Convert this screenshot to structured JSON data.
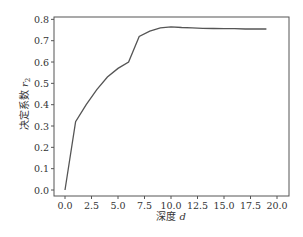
{
  "chart_data": {
    "type": "line",
    "title": "",
    "xlabel": "深度 d",
    "ylabel": "决定系数 r₂",
    "xlabel_text": "深度",
    "xlabel_var": "d",
    "ylabel_text": "决定系数",
    "ylabel_var": "r",
    "ylabel_sub": "2",
    "xlim": [
      -1.0,
      21.3
    ],
    "ylim": [
      -0.04,
      0.8
    ],
    "xticks": [
      0.0,
      2.5,
      5.0,
      7.5,
      10.0,
      12.5,
      15.0,
      17.5,
      20.0
    ],
    "xtick_labels": [
      "0.0",
      "2.5",
      "5.0",
      "7.5",
      "10.0",
      "12.5",
      "15.0",
      "17.5",
      "20.0"
    ],
    "yticks": [
      0.0,
      0.1,
      0.2,
      0.3,
      0.4,
      0.5,
      0.6,
      0.7,
      0.8
    ],
    "ytick_labels": [
      "0.0",
      "0.1",
      "0.2",
      "0.3",
      "0.4",
      "0.5",
      "0.6",
      "0.7",
      "0.8"
    ],
    "grid": false,
    "legend": null,
    "line_color": "#555555",
    "series": [
      {
        "name": "r2",
        "x": [
          0,
          1,
          2,
          3,
          4,
          5,
          6,
          7,
          8,
          9,
          10,
          11,
          12,
          13,
          14,
          15,
          16,
          17,
          18,
          19
        ],
        "values": [
          0.0,
          0.32,
          0.4,
          0.47,
          0.53,
          0.57,
          0.6,
          0.72,
          0.745,
          0.76,
          0.765,
          0.762,
          0.76,
          0.758,
          0.757,
          0.756,
          0.756,
          0.755,
          0.755,
          0.755
        ]
      }
    ]
  }
}
